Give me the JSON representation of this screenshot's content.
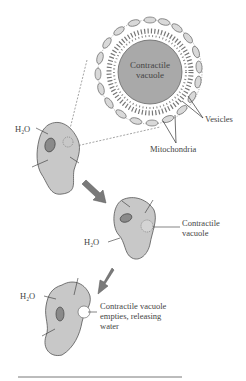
{
  "diagram": {
    "type": "biology-illustration",
    "magnified_view": {
      "center_label_line1": "Contractile",
      "center_label_line2": "vacuole",
      "vesicles_label": "Vesicles",
      "mitochondria_label": "Mitochondria"
    },
    "stage1": {
      "water_label": "H₂O"
    },
    "stage2": {
      "water_label": "H₂O",
      "vacuole_label_line1": "Contractile",
      "vacuole_label_line2": "vacuole"
    },
    "stage3": {
      "water_label": "H₂O",
      "empty_label_line1": "Contractile vacuole",
      "empty_label_line2": "empties, releasing",
      "empty_label_line3": "water"
    },
    "colors": {
      "cell_fill": "#c8c8c8",
      "vacuole_fill": "#a9a9a9",
      "arrow_fill": "#7a7a7a",
      "line": "#444444"
    }
  }
}
